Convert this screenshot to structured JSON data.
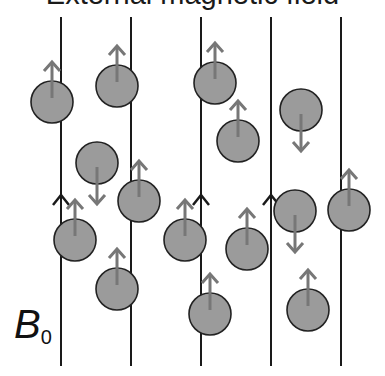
{
  "title": "External magnetic field",
  "label": {
    "symbol": "B",
    "subscript": "0"
  },
  "colors": {
    "line": "#1a1a1a",
    "particle_fill": "#9b9b9b",
    "particle_stroke": "#222222",
    "spin_arrow": "#777777"
  },
  "field_lines": [
    {
      "x": 61,
      "y1": 17,
      "y2": 366,
      "arrow_y": 195
    },
    {
      "x": 131,
      "y1": 17,
      "y2": 366,
      "arrow_y": 195
    },
    {
      "x": 201,
      "y1": 17,
      "y2": 366,
      "arrow_y": 195
    },
    {
      "x": 271,
      "y1": 17,
      "y2": 366,
      "arrow_y": 195
    },
    {
      "x": 341,
      "y1": 17,
      "y2": 366,
      "arrow_y": 195
    }
  ],
  "particles": [
    {
      "cx": 52,
      "cy": 102,
      "spin": "up"
    },
    {
      "cx": 117,
      "cy": 86,
      "spin": "up"
    },
    {
      "cx": 215,
      "cy": 83,
      "spin": "up"
    },
    {
      "cx": 238,
      "cy": 141,
      "spin": "up"
    },
    {
      "cx": 301,
      "cy": 110,
      "spin": "down"
    },
    {
      "cx": 97,
      "cy": 163,
      "spin": "down"
    },
    {
      "cx": 139,
      "cy": 201,
      "spin": "up"
    },
    {
      "cx": 75,
      "cy": 240,
      "spin": "up"
    },
    {
      "cx": 185,
      "cy": 240,
      "spin": "up"
    },
    {
      "cx": 247,
      "cy": 249,
      "spin": "up"
    },
    {
      "cx": 295,
      "cy": 211,
      "spin": "down"
    },
    {
      "cx": 349,
      "cy": 210,
      "spin": "up"
    },
    {
      "cx": 117,
      "cy": 289,
      "spin": "up"
    },
    {
      "cx": 210,
      "cy": 314,
      "spin": "up"
    },
    {
      "cx": 308,
      "cy": 310,
      "spin": "up"
    }
  ],
  "particle_radius": 21
}
